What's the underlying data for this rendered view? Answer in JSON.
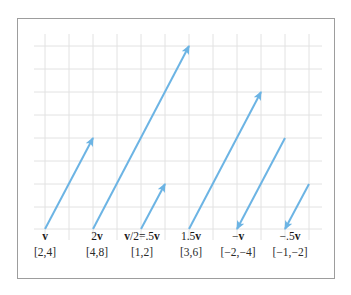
{
  "figure": {
    "colors": {
      "arrow": "#6cb4e4",
      "grid": "#e2e2e2",
      "frame": "#9d9d9d",
      "text": "#1a1a1a"
    },
    "grid": {
      "x_lines": [
        45,
        69,
        93,
        117,
        141,
        165,
        189,
        213,
        237,
        261,
        285,
        309
      ],
      "y_lines": [
        46,
        69,
        92,
        115,
        138,
        161,
        184,
        207,
        229
      ],
      "x_start": 34,
      "x_end": 322,
      "y_start": 34,
      "y_end": 240
    },
    "vectors": [
      {
        "name": "v",
        "label_scalar": "",
        "label_bold": "v",
        "label_suffix": "",
        "coords": "[2,4]",
        "x1": 45,
        "y1": 229,
        "x2": 93,
        "y2": 138,
        "label_x": 45
      },
      {
        "name": "2v",
        "label_scalar": "2",
        "label_bold": "v",
        "label_suffix": "",
        "coords": "[4,8]",
        "x1": 93,
        "y1": 229,
        "x2": 189,
        "y2": 46,
        "label_x": 97
      },
      {
        "name": "v/2=.5v",
        "label_scalar": "",
        "label_bold": "v",
        "label_suffix": "/2=.5",
        "label_bold2": "v",
        "coords": "[1,2]",
        "x1": 141,
        "y1": 229,
        "x2": 165,
        "y2": 184,
        "label_x": 142
      },
      {
        "name": "1.5v",
        "label_scalar": "1.5",
        "label_bold": "v",
        "label_suffix": "",
        "coords": "[3,6]",
        "x1": 189,
        "y1": 229,
        "x2": 261,
        "y2": 92,
        "label_x": 191
      },
      {
        "name": "-v",
        "label_scalar": "−",
        "label_bold": "v",
        "label_suffix": "",
        "coords": "[−2,−4]",
        "x1": 285,
        "y1": 138,
        "x2": 237,
        "y2": 229,
        "label_x": 238
      },
      {
        "name": "-.5v",
        "label_scalar": "−.5",
        "label_bold": "v",
        "label_suffix": "",
        "coords": "[−1,−2]",
        "x1": 309,
        "y1": 184,
        "x2": 285,
        "y2": 229,
        "label_x": 290
      }
    ]
  }
}
